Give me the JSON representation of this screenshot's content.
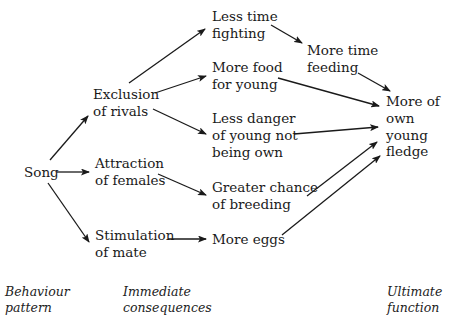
{
  "diagram": {
    "nodes": {
      "song": {
        "lines": [
          "Song"
        ]
      },
      "exclusion": {
        "lines": [
          "Exclusion",
          "of rivals"
        ]
      },
      "attraction": {
        "lines": [
          "Attraction",
          "of females"
        ]
      },
      "stimulation": {
        "lines": [
          "Stimulation",
          "of mate"
        ]
      },
      "less_fighting": {
        "lines": [
          "Less time",
          "fighting"
        ]
      },
      "more_food": {
        "lines": [
          "More food",
          "for young"
        ]
      },
      "less_danger": {
        "lines": [
          "Less danger",
          "of young not",
          "being own"
        ]
      },
      "greater_chance": {
        "lines": [
          "Greater chance",
          "of breeding"
        ]
      },
      "more_eggs": {
        "lines": [
          "More eggs"
        ]
      },
      "more_feeding": {
        "lines": [
          "More time",
          "feeding"
        ]
      },
      "fledge": {
        "lines": [
          "More of",
          "own",
          "young",
          "fledge"
        ]
      }
    },
    "edges": [
      [
        "song",
        "exclusion"
      ],
      [
        "song",
        "attraction"
      ],
      [
        "song",
        "stimulation"
      ],
      [
        "exclusion",
        "less_fighting"
      ],
      [
        "exclusion",
        "more_food"
      ],
      [
        "exclusion",
        "less_danger"
      ],
      [
        "attraction",
        "greater_chance"
      ],
      [
        "stimulation",
        "more_eggs"
      ],
      [
        "less_fighting",
        "more_feeding"
      ],
      [
        "more_feeding",
        "fledge"
      ],
      [
        "more_food",
        "fledge"
      ],
      [
        "less_danger",
        "fledge"
      ],
      [
        "greater_chance",
        "fledge"
      ],
      [
        "more_eggs",
        "fledge"
      ]
    ],
    "column_labels": {
      "behaviour": [
        "Behaviour",
        "pattern"
      ],
      "immediate": [
        "Immediate",
        "consequences"
      ],
      "ultimate": [
        "Ultimate",
        "function"
      ]
    }
  }
}
